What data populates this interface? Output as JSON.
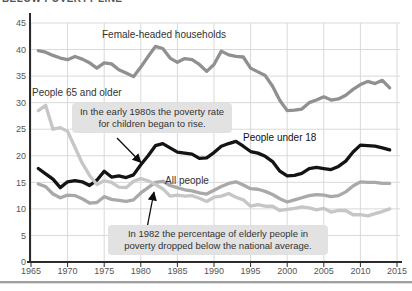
{
  "header": {
    "clipped_title": "BELOW POVERTY LINE"
  },
  "chart_data": {
    "type": "line",
    "title": "BELOW POVERTY LINE",
    "xlabel": "",
    "ylabel": "",
    "xlim": [
      1965,
      2015
    ],
    "ylim": [
      0,
      45
    ],
    "grid": true,
    "x_ticks": [
      1965,
      1970,
      1975,
      1980,
      1985,
      1990,
      1995,
      2000,
      2005,
      2010,
      2015
    ],
    "y_ticks": [
      0,
      5,
      10,
      15,
      20,
      25,
      30,
      35,
      40,
      45
    ],
    "years": [
      1966,
      1967,
      1968,
      1969,
      1970,
      1971,
      1972,
      1973,
      1974,
      1975,
      1976,
      1977,
      1978,
      1979,
      1980,
      1981,
      1982,
      1983,
      1984,
      1985,
      1986,
      1987,
      1988,
      1989,
      1990,
      1991,
      1992,
      1993,
      1994,
      1995,
      1996,
      1997,
      1998,
      1999,
      2000,
      2001,
      2002,
      2003,
      2004,
      2005,
      2006,
      2007,
      2008,
      2009,
      2010,
      2011,
      2012,
      2013,
      2014
    ],
    "series": [
      {
        "name": "All people",
        "color": "#a9a9a9",
        "values": [
          14.7,
          14.2,
          12.8,
          12.1,
          12.6,
          12.5,
          11.9,
          11.1,
          11.2,
          12.3,
          11.8,
          11.6,
          11.4,
          11.7,
          13.0,
          14.0,
          15.0,
          15.2,
          14.4,
          14.0,
          13.6,
          13.4,
          13.0,
          12.8,
          13.5,
          14.2,
          14.8,
          15.1,
          14.5,
          13.8,
          13.7,
          13.3,
          12.7,
          11.9,
          11.3,
          11.7,
          12.1,
          12.5,
          12.7,
          12.6,
          12.3,
          12.5,
          13.2,
          14.3,
          15.1,
          15.0,
          15.0,
          14.8,
          14.8
        ]
      },
      {
        "name": "Female-headed households",
        "color": "#909090",
        "values": [
          39.8,
          39.5,
          38.9,
          38.4,
          38.1,
          38.7,
          38.2,
          37.5,
          36.5,
          37.5,
          37.3,
          36.2,
          35.6,
          34.9,
          36.7,
          38.7,
          40.6,
          40.2,
          38.4,
          37.6,
          38.3,
          38.1,
          37.2,
          35.9,
          37.2,
          39.7,
          39.0,
          38.7,
          38.6,
          36.5,
          35.8,
          35.1,
          33.1,
          30.4,
          28.5,
          28.6,
          28.8,
          30.0,
          30.5,
          31.1,
          30.5,
          30.7,
          31.4,
          32.5,
          33.4,
          34.0,
          33.6,
          34.2,
          32.8
        ]
      },
      {
        "name": "People under 18",
        "color": "#141414",
        "values": [
          17.6,
          16.6,
          15.6,
          14.0,
          15.1,
          15.3,
          15.1,
          14.4,
          15.4,
          17.1,
          16.0,
          16.2,
          15.9,
          16.4,
          18.3,
          20.0,
          21.9,
          22.3,
          21.5,
          20.7,
          20.5,
          20.3,
          19.5,
          19.6,
          20.6,
          21.8,
          22.3,
          22.7,
          21.8,
          20.8,
          20.5,
          19.9,
          18.9,
          17.1,
          16.2,
          16.3,
          16.7,
          17.6,
          17.8,
          17.6,
          17.4,
          18.0,
          19.0,
          20.7,
          22.0,
          21.9,
          21.8,
          21.5,
          21.1
        ]
      },
      {
        "name": "People 65 and older",
        "color": "#c6c6c6",
        "values": [
          28.5,
          29.5,
          25.0,
          25.3,
          24.6,
          21.6,
          18.6,
          16.3,
          14.6,
          15.3,
          15.0,
          14.1,
          14.0,
          15.2,
          15.7,
          15.3,
          14.6,
          13.8,
          12.4,
          12.6,
          12.4,
          12.5,
          12.0,
          11.4,
          12.2,
          12.4,
          12.9,
          12.2,
          11.7,
          10.5,
          10.8,
          10.5,
          10.5,
          9.7,
          9.9,
          10.1,
          10.4,
          10.2,
          9.8,
          10.1,
          9.4,
          9.7,
          9.7,
          8.9,
          8.9,
          8.7,
          9.1,
          9.5,
          10.0
        ]
      }
    ],
    "annotations": [
      {
        "text": "In the early 1980s the poverty rate for children began to rise."
      },
      {
        "text": "In 1982 the percentage of elderly people in poverty dropped below the national average."
      }
    ],
    "legend_position": "inline-labels"
  },
  "style": {
    "grid_color": "#d9d9d9",
    "axis_color": "#2b2b2b",
    "tick_label_color": "#555555",
    "annotation_bg": "#e2e2e2"
  }
}
